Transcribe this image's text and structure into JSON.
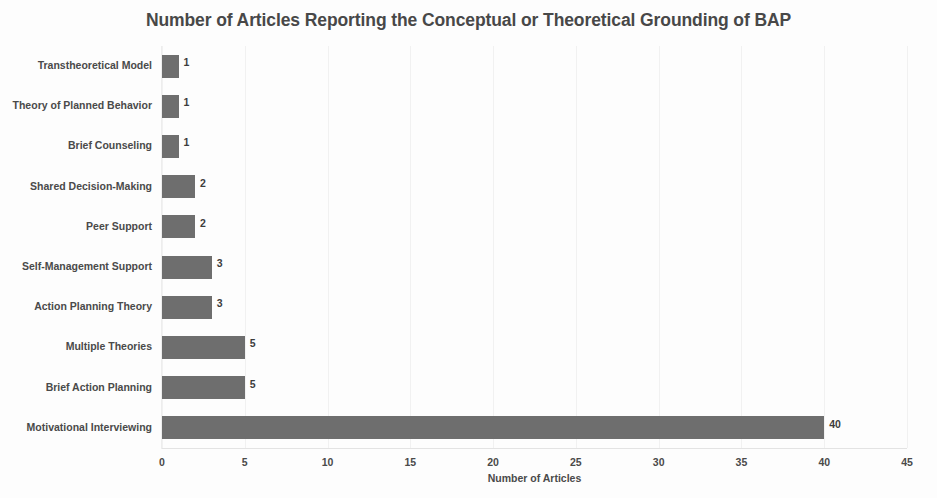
{
  "chart_data": {
    "type": "bar",
    "orientation": "horizontal",
    "title": "Number of Articles Reporting the Conceptual or Theoretical Grounding of BAP",
    "xlabel": "Number of Articles",
    "ylabel": "",
    "categories": [
      "Transtheoretical Model",
      "Theory of Planned Behavior",
      "Brief Counseling",
      "Shared Decision-Making",
      "Peer Support",
      "Self-Management Support",
      "Action Planning Theory",
      "Multiple Theories",
      "Brief Action Planning",
      "Motivational Interviewing"
    ],
    "values": [
      1,
      1,
      1,
      2,
      2,
      3,
      3,
      5,
      5,
      40
    ],
    "data_labels": [
      "1",
      "1",
      "1",
      "2",
      "2",
      "3",
      "3",
      "5",
      "5",
      "40"
    ],
    "xlim": [
      0,
      45
    ],
    "xticks": [
      0,
      5,
      10,
      15,
      20,
      25,
      30,
      35,
      40,
      45
    ],
    "xtick_labels": [
      "0",
      "5",
      "10",
      "15",
      "20",
      "25",
      "30",
      "35",
      "40",
      "45"
    ],
    "grid": true,
    "grid_axis": "x",
    "legend": false,
    "bar_color": "#6e6e6e",
    "text_color": "#4a4a4a",
    "title_color": "#484848",
    "background": "#fdfdfd"
  }
}
